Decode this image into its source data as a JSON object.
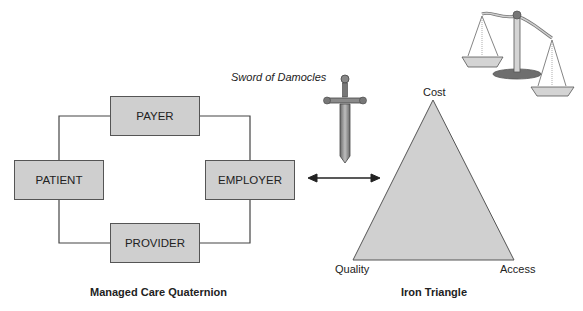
{
  "quaternion": {
    "title": "Managed Care Quaternion",
    "nodes": {
      "top": "PAYER",
      "left": "PATIENT",
      "right": "EMPLOYER",
      "bottom": "PROVIDER"
    }
  },
  "sword": {
    "label": "Sword of Damocles"
  },
  "triangle": {
    "title": "Iron Triangle",
    "vertices": {
      "top": "Cost",
      "bottom_left": "Quality",
      "bottom_right": "Access"
    }
  },
  "colors": {
    "box_fill": "#cfcfcf",
    "triangle_fill": "#d0d0d0",
    "stroke": "#444444"
  }
}
